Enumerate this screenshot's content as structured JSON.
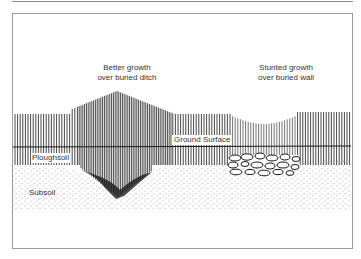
{
  "figure": {
    "labels": {
      "ditch_line1": "Better growth",
      "ditch_line2": "over buried ditch",
      "wall_line1": "Stunted growth",
      "wall_line2": "over buried wall",
      "ground_surface": "Ground Surface",
      "ploughsoil": "Ploughsoil",
      "subsoil": "Subsoil"
    },
    "features": [
      {
        "name": "buried-ditch",
        "effect": "Better growth"
      },
      {
        "name": "buried-wall",
        "effect": "Stunted growth"
      }
    ],
    "colors": {
      "ink": "#1a1a1a",
      "frame": "#9a9a9a",
      "ditch_fill": "#2a2a2a"
    }
  }
}
